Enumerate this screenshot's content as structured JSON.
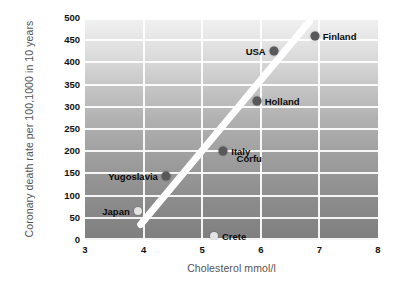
{
  "chart_data": {
    "type": "scatter",
    "title": "",
    "xlabel": "Cholesterol mmol/l",
    "ylabel": "Coronary death rate per 100,1000 in 10 years",
    "xlim": [
      3,
      8
    ],
    "ylim": [
      0,
      500
    ],
    "xticks": [
      3,
      4,
      5,
      6,
      7,
      8
    ],
    "yticks": [
      0,
      50,
      100,
      150,
      200,
      250,
      300,
      350,
      400,
      450,
      500
    ],
    "grid": true,
    "legend": "none",
    "points": [
      {
        "label": "Finland",
        "x": 6.92,
        "y": 460,
        "marker": "dark",
        "label_side": "right"
      },
      {
        "label": "USA",
        "x": 6.22,
        "y": 425,
        "marker": "dark",
        "label_side": "left"
      },
      {
        "label": "Holland",
        "x": 5.93,
        "y": 312,
        "marker": "dark",
        "label_side": "right"
      },
      {
        "label": "Italy",
        "x": 5.36,
        "y": 200,
        "marker": "dark",
        "label_side": "right"
      },
      {
        "label": "Corfu",
        "x": 5.45,
        "y": 185,
        "marker": "faint",
        "label_side": "right"
      },
      {
        "label": "Yugoslavia",
        "x": 4.38,
        "y": 145,
        "marker": "dark",
        "label_side": "left"
      },
      {
        "label": "Japan",
        "x": 3.9,
        "y": 65,
        "marker": "light",
        "label_side": "left"
      },
      {
        "label": "Crete",
        "x": 5.2,
        "y": 10,
        "marker": "light",
        "label_side": "right"
      }
    ],
    "trendline": {
      "x_start": 3.95,
      "y_start": 35,
      "x_end": 6.83,
      "y_end": 492,
      "color": "#ffffff"
    },
    "colors": {
      "marker_dark": "#59595b",
      "marker_light": "#e4e4e4",
      "gridline": "#ffffff",
      "axis_text": "#111111",
      "axis_title": "#545454",
      "panel_top": "#f1f1f1",
      "panel_bottom": "#7f7f7f"
    }
  }
}
